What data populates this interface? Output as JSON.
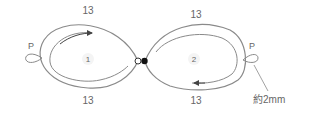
{
  "diagram": {
    "type": "tatting-pattern",
    "rings": [
      {
        "id": "ring-1",
        "number": "1",
        "top_count": "13",
        "bottom_count": "13",
        "picot_label": "P",
        "direction": "clockwise"
      },
      {
        "id": "ring-2",
        "number": "2",
        "top_count": "13",
        "bottom_count": "13",
        "picot_label": "P",
        "direction": "clockwise"
      }
    ],
    "picot_note": "約2mm",
    "colors": {
      "line": "#8a8a8a",
      "text": "#666666",
      "dot": "#111111"
    }
  }
}
